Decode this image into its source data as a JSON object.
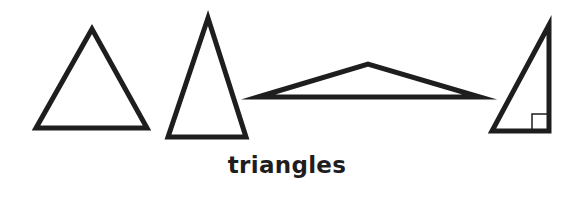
{
  "caption": "triangles",
  "stroke_color": "#1e1e1e",
  "fill_color": "#ffffff",
  "stroke_width": 5,
  "shapes": [
    {
      "name": "equilateral-triangle",
      "points": "92,29 36,128 147,128"
    },
    {
      "name": "isosceles-triangle",
      "points": "208,18 168,137 246,137"
    },
    {
      "name": "obtuse-triangle",
      "points": "258,97 368,64 480,97"
    },
    {
      "name": "right-triangle",
      "points": "549,25 492,131 549,131",
      "right_angle_marker": {
        "x": 532,
        "y": 114,
        "size": 17
      }
    }
  ]
}
